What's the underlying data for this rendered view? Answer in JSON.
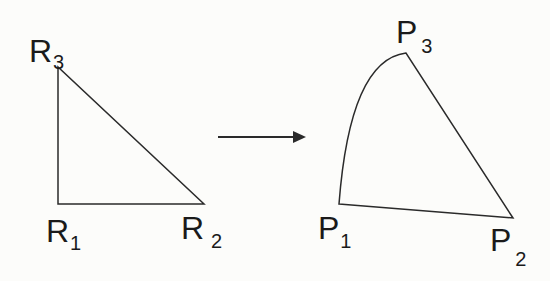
{
  "diagram": {
    "type": "triangle-mapping",
    "source_triangle": {
      "vertices": [
        {
          "id": "R1",
          "letter": "R",
          "sub": "1",
          "x": 58,
          "y": 204
        },
        {
          "id": "R2",
          "letter": "R",
          "sub": "2",
          "x": 204,
          "y": 204
        },
        {
          "id": "R3",
          "letter": "R",
          "sub": "3",
          "x": 58,
          "y": 67
        }
      ],
      "edges": [
        "R1-R2",
        "R2-R3",
        "R3-R1"
      ]
    },
    "arrow": {
      "from": [
        218,
        137
      ],
      "to": [
        303,
        137
      ],
      "direction": "right"
    },
    "target_shape": {
      "vertices": [
        {
          "id": "P1",
          "letter": "P",
          "sub": "1",
          "x": 339,
          "y": 204
        },
        {
          "id": "P2",
          "letter": "P",
          "sub": "2",
          "x": 513,
          "y": 218
        },
        {
          "id": "P3",
          "letter": "P",
          "sub": "3",
          "x": 406,
          "y": 53
        }
      ],
      "edges": [
        "P1-P2 (straight)",
        "P2-P3 (straight)",
        "P3-P1 (curved arc)"
      ]
    },
    "colors": {
      "stroke": "#2a2a2a",
      "background": "#fcfcfa"
    }
  },
  "labels": {
    "R3": {
      "letter": "R",
      "sub": "3"
    },
    "R1": {
      "letter": "R",
      "sub": "1"
    },
    "R2": {
      "letter": "R",
      "sub": "2"
    },
    "P3": {
      "letter": "P",
      "sub": "3"
    },
    "P1": {
      "letter": "P",
      "sub": "1"
    },
    "P2": {
      "letter": "P",
      "sub": "2"
    }
  }
}
